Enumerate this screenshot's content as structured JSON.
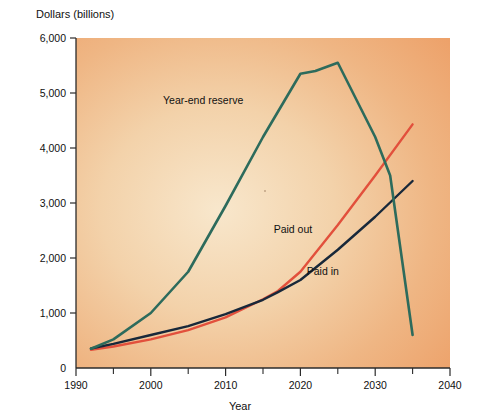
{
  "chart_data": {
    "type": "line",
    "title": "",
    "subtitle": "",
    "xlabel": "Year",
    "ylabel": "Dollars (billions)",
    "xlim": [
      1990,
      2040
    ],
    "ylim": [
      0,
      6000
    ],
    "xticks": [
      1990,
      2000,
      2010,
      2020,
      2030,
      2040
    ],
    "xtick_labels": [
      "1990",
      "2000",
      "2010",
      "2020",
      "2030",
      "2040"
    ],
    "xminor_ticks": [
      1995,
      2005,
      2015,
      2025,
      2035
    ],
    "yticks": [
      0,
      1000,
      2000,
      3000,
      4000,
      5000,
      6000
    ],
    "ytick_labels": [
      "0",
      "1,000",
      "2,000",
      "3,000",
      "4,000",
      "5,000",
      "6,000"
    ],
    "grid": false,
    "legend_position": "inline-annotations",
    "series": [
      {
        "name": "Year-end reserve",
        "color": "#2d6b5c",
        "label_x": 2007,
        "label_y": 4800,
        "x": [
          1992,
          1995,
          2000,
          2005,
          2010,
          2015,
          2020,
          2022,
          2025,
          2030,
          2032,
          2035
        ],
        "values": [
          350,
          520,
          1000,
          1750,
          2950,
          4200,
          5350,
          5400,
          5550,
          4200,
          3500,
          600
        ]
      },
      {
        "name": "Paid out",
        "color": "#e2503c",
        "label_x": 2019,
        "label_y": 2450,
        "x": [
          1992,
          1995,
          2000,
          2005,
          2010,
          2015,
          2017,
          2020,
          2025,
          2030,
          2035
        ],
        "values": [
          330,
          390,
          520,
          690,
          920,
          1250,
          1400,
          1750,
          2600,
          3500,
          4430
        ]
      },
      {
        "name": "Paid in",
        "color": "#18283a",
        "label_x": 2023,
        "label_y": 1700,
        "x": [
          1992,
          1995,
          2000,
          2005,
          2010,
          2015,
          2017,
          2020,
          2025,
          2030,
          2035
        ],
        "values": [
          355,
          440,
          600,
          760,
          980,
          1240,
          1380,
          1600,
          2150,
          2750,
          3400
        ]
      }
    ]
  },
  "axes": {
    "ylabel": "Dollars (billions)",
    "xlabel": "Year"
  },
  "ytick_labels": {
    "t0": "0",
    "t1": "1,000",
    "t2": "2,000",
    "t3": "3,000",
    "t4": "4,000",
    "t5": "5,000",
    "t6": "6,000"
  },
  "xtick_labels": {
    "t0": "1990",
    "t1": "2000",
    "t2": "2010",
    "t3": "2020",
    "t4": "2030",
    "t5": "2040"
  },
  "series_labels": {
    "reserve": "Year-end reserve",
    "paid_out": "Paid out",
    "paid_in": "Paid in"
  },
  "colors": {
    "reserve": "#2d6b5c",
    "paid_out": "#e2503c",
    "paid_in": "#18283a",
    "plot_bg_edge": "#efa670",
    "plot_bg_center": "#f7e2c4",
    "axis": "#2b2b2b"
  }
}
